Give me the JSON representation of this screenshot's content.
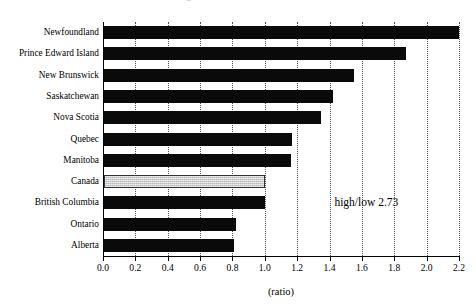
{
  "chart_data": {
    "type": "bar",
    "orientation": "horizontal",
    "title": "",
    "title_remnant": "g",
    "xlabel": "(ratio)",
    "ylabel": "",
    "xlim": [
      0.0,
      2.2
    ],
    "xticks": [
      "0.0",
      "0.2",
      "0.4",
      "0.6",
      "0.8",
      "1.0",
      "1.2",
      "1.4",
      "1.6",
      "1.8",
      "2.0",
      "2.2"
    ],
    "xtick_values": [
      0.0,
      0.2,
      0.4,
      0.6,
      0.8,
      1.0,
      1.2,
      1.4,
      1.6,
      1.8,
      2.0,
      2.2
    ],
    "grid": "vertical-dotted",
    "legend": "none",
    "categories": [
      "Newfoundland",
      "Prince Edward Island",
      "New Brunswick",
      "Saskatchewan",
      "Nova Scotia",
      "Quebec",
      "Manitoba",
      "Canada",
      "British Columbia",
      "Ontario",
      "Alberta"
    ],
    "values": [
      2.2,
      1.87,
      1.55,
      1.42,
      1.35,
      1.17,
      1.16,
      1.0,
      1.0,
      0.82,
      0.81
    ],
    "highlight_category": "Canada",
    "bar_color": "#0a0a0a",
    "highlight_color": "#b9b9b9",
    "annotations": [
      {
        "text": "high/low 2.73",
        "x": 1.43,
        "y_category": "British Columbia"
      }
    ]
  }
}
